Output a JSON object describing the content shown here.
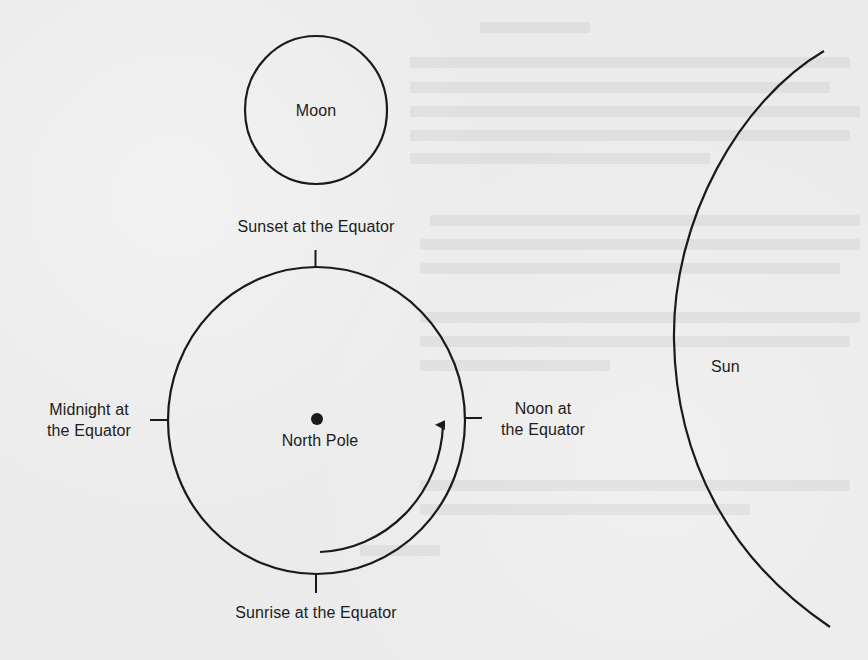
{
  "diagram": {
    "type": "earth-moon-sun-orbit-diagram",
    "colors": {
      "background": "#ebebeb",
      "stroke": "#1a1a1a",
      "text": "#1c1c1c"
    },
    "bodies": {
      "moon": {
        "label": "Moon"
      },
      "earth": {
        "center_label": "North Pole"
      },
      "sun": {
        "label": "Sun"
      }
    },
    "equator_positions": {
      "top": {
        "label": "Sunset at the Equator"
      },
      "left": {
        "label": "Midnight at\nthe Equator"
      },
      "right": {
        "label": "Noon at\nthe Equator"
      },
      "bottom": {
        "label": "Sunrise at the Equator"
      }
    },
    "rotation_arrow": {
      "direction": "counterclockwise"
    }
  }
}
